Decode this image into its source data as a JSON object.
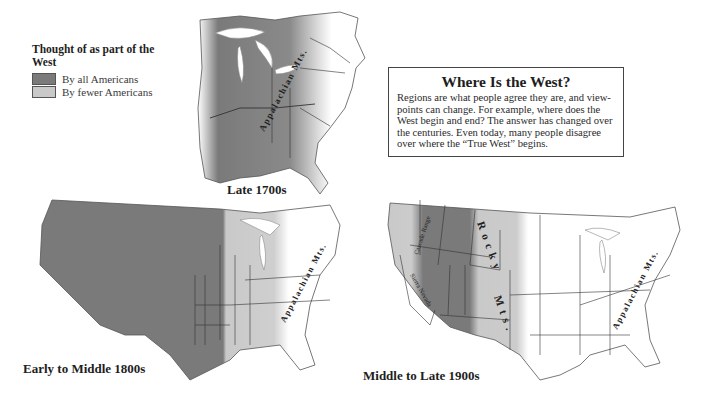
{
  "legend": {
    "title": "Thought of as part of the West",
    "items": [
      {
        "label": "By all Americans",
        "color": "#7a7a7a"
      },
      {
        "label": "By fewer Americans",
        "color": "#c9c9c9"
      }
    ]
  },
  "infobox": {
    "title": "Where Is the West?",
    "body": "Regions are what people agree they are, and view-points can change.  For example, where does the West begin and end?  The answer has changed over the centuries.  Even today, many people disagree over where the “True West” begins."
  },
  "maps": [
    {
      "label": "Late 1700s",
      "annotations": [
        "Appalachian Mts."
      ]
    },
    {
      "label": "Early to Middle 1800s",
      "annotations": [
        "Appalachian Mts."
      ]
    },
    {
      "label": "Middle to Late 1900s",
      "annotations": [
        "Rocky Mts.",
        "Cascade Range",
        "Sierra Nevada",
        "Appalachian Mts."
      ]
    }
  ],
  "colors": {
    "dark": "#7a7a7a",
    "light": "#c9c9c9",
    "outline": "#3a3a3a",
    "water": "#ffffff"
  }
}
